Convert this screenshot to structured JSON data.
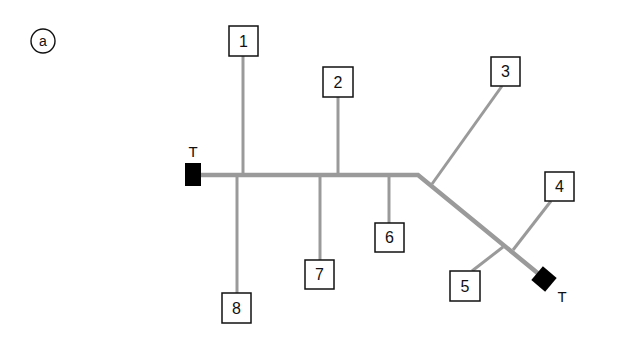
{
  "figure": {
    "panel_label": "a",
    "bus_color": "#9a9a9a",
    "branch_color": "#9a9a9a",
    "terminator_color": "#000000",
    "terminators": [
      {
        "id": "t-left",
        "label": "T"
      },
      {
        "id": "t-right",
        "label": "T"
      }
    ],
    "nodes": [
      {
        "id": "1",
        "label": "1"
      },
      {
        "id": "2",
        "label": "2"
      },
      {
        "id": "3",
        "label": "3"
      },
      {
        "id": "4",
        "label": "4"
      },
      {
        "id": "5",
        "label": "5"
      },
      {
        "id": "6",
        "label": "6"
      },
      {
        "id": "7",
        "label": "7"
      },
      {
        "id": "8",
        "label": "8"
      }
    ]
  }
}
